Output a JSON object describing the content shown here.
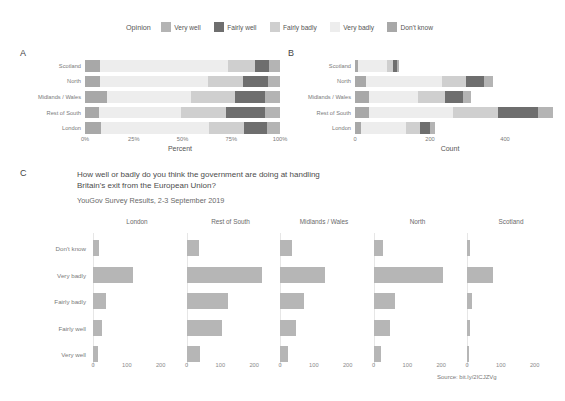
{
  "legend": {
    "title": "Opinion",
    "items": [
      {
        "label": "Very well",
        "color": "#b4b4b4"
      },
      {
        "label": "Fairly well",
        "color": "#6e6e6e"
      },
      {
        "label": "Fairly badly",
        "color": "#cfcfcf"
      },
      {
        "label": "Very badly",
        "color": "#ededed"
      },
      {
        "label": "Don't know",
        "color": "#a8a8a8"
      }
    ]
  },
  "panels": {
    "a": {
      "tag": "A",
      "xlabel": "Percent",
      "xticks": [
        "0%",
        "25%",
        "50%",
        "75%",
        "100%"
      ],
      "ytick_labels": [
        "Scotland",
        "North",
        "Midlands / Wales",
        "Rest of South",
        "London"
      ]
    },
    "b": {
      "tag": "B",
      "xlabel": "Count",
      "xticks": [
        "0",
        "200",
        "400"
      ],
      "ytick_labels": [
        "Scotland",
        "North",
        "Midlands / Wales",
        "Rest of South",
        "London"
      ]
    },
    "c": {
      "tag": "C",
      "title": "How well or badly do you think the government are doing at handling Britain's exit from the European Union?",
      "subtitle": "YouGov Survey Results, 2-3 September 2019",
      "source": "Source: bit.ly/2ICJZVg",
      "facet_titles": [
        "London",
        "Rest of South",
        "Midlands / Wales",
        "North",
        "Scotland"
      ],
      "ytick_labels": [
        "Don't know",
        "Very badly",
        "Fairly badly",
        "Fairly well",
        "Very well"
      ],
      "xticks": [
        "0",
        "100",
        "200"
      ]
    }
  },
  "chart_data": [
    {
      "type": "bar",
      "id": "panel-a",
      "orientation": "horizontal",
      "stacked": true,
      "normalized": true,
      "title": "",
      "xlabel": "Percent",
      "ylabel": "",
      "xlim": [
        0,
        100
      ],
      "xticks": [
        0,
        25,
        50,
        75,
        100
      ],
      "grid": false,
      "legend": "top",
      "categories": [
        "Scotland",
        "North",
        "Midlands / Wales",
        "Rest of South",
        "London"
      ],
      "series": [
        {
          "name": "Don't know",
          "color": "#a8a8a8",
          "values": [
            7.5,
            7.8,
            11.5,
            7.2,
            8.0
          ]
        },
        {
          "name": "Very badly",
          "color": "#ededed",
          "values": [
            66.0,
            55.5,
            43.0,
            42.0,
            55.5
          ]
        },
        {
          "name": "Fairly badly",
          "color": "#cfcfcf",
          "values": [
            13.5,
            17.5,
            22.5,
            23.0,
            18.0
          ]
        },
        {
          "name": "Fairly well",
          "color": "#6e6e6e",
          "values": [
            7.5,
            13.0,
            15.5,
            20.0,
            12.0
          ]
        },
        {
          "name": "Very well",
          "color": "#b4b4b4",
          "values": [
            5.5,
            6.2,
            7.5,
            7.8,
            6.5
          ]
        }
      ]
    },
    {
      "type": "bar",
      "id": "panel-b",
      "orientation": "horizontal",
      "stacked": true,
      "normalized": false,
      "title": "",
      "xlabel": "Count",
      "ylabel": "",
      "xlim": [
        0,
        520
      ],
      "xticks": [
        0,
        200,
        400
      ],
      "grid": false,
      "legend": "top",
      "categories": [
        "Scotland",
        "North",
        "Midlands / Wales",
        "Rest of South",
        "London"
      ],
      "series": [
        {
          "name": "Don't know",
          "color": "#a8a8a8",
          "values": [
            8,
            29,
            36,
            38,
            17
          ]
        },
        {
          "name": "Very badly",
          "color": "#ededed",
          "values": [
            78,
            204,
            133,
            222,
            118
          ]
        },
        {
          "name": "Fairly badly",
          "color": "#cfcfcf",
          "values": [
            16,
            64,
            70,
            122,
            38
          ]
        },
        {
          "name": "Fairly well",
          "color": "#6e6e6e",
          "values": [
            9,
            48,
            48,
            106,
            26
          ]
        },
        {
          "name": "Very well",
          "color": "#b4b4b4",
          "values": [
            6,
            23,
            23,
            41,
            14
          ]
        }
      ]
    },
    {
      "type": "bar",
      "id": "panel-c",
      "orientation": "horizontal",
      "stacked": false,
      "faceted": true,
      "title": "How well or badly do you think the government are doing at handling Britain's exit from the European Union?",
      "subtitle": "YouGov Survey Results, 2-3 September 2019",
      "xlabel": "",
      "ylabel": "",
      "xlim": [
        0,
        260
      ],
      "xticks": [
        0,
        100,
        200
      ],
      "grid": false,
      "bar_color": "#b6b6b6",
      "categories": [
        "Don't know",
        "Very badly",
        "Fairly badly",
        "Fairly well",
        "Very well"
      ],
      "facets": [
        {
          "name": "London",
          "values": [
            17,
            118,
            38,
            26,
            14
          ]
        },
        {
          "name": "Rest of South",
          "values": [
            38,
            222,
            122,
            106,
            41
          ]
        },
        {
          "name": "Midlands / Wales",
          "values": [
            36,
            133,
            70,
            48,
            23
          ]
        },
        {
          "name": "North",
          "values": [
            29,
            204,
            64,
            48,
            23
          ]
        },
        {
          "name": "Scotland",
          "values": [
            8,
            78,
            16,
            9,
            6
          ]
        }
      ]
    }
  ]
}
